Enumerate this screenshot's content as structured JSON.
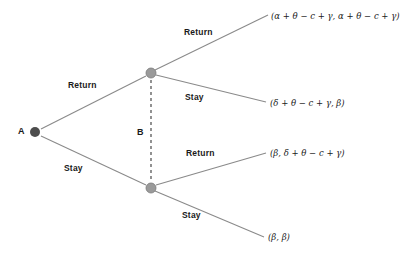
{
  "diagram": {
    "type": "game-tree",
    "title": "",
    "background_color": "#ffffff",
    "edge_color": "#8a8a8a",
    "info_set_color": "#4a4a4a",
    "nodes": [
      {
        "id": "A",
        "label": "A",
        "kind": "root-decision",
        "player": "A",
        "color": "#4d4d4d",
        "x": 35,
        "y": 132
      },
      {
        "id": "B_top",
        "label": "B",
        "kind": "decision",
        "player": "B",
        "color": "#9a9a9a",
        "x": 151,
        "y": 73
      },
      {
        "id": "B_bottom",
        "label": "",
        "kind": "decision",
        "player": "B",
        "color": "#9a9a9a",
        "x": 151,
        "y": 188
      }
    ],
    "information_set": {
      "label": "B",
      "style": "dashed",
      "connects": [
        "B_top",
        "B_bottom"
      ]
    },
    "edges": [
      {
        "from": "A",
        "to": "B_top",
        "label": "Return"
      },
      {
        "from": "A",
        "to": "B_bottom",
        "label": "Stay"
      },
      {
        "from": "B_top",
        "to": "payoff_1",
        "label": "Return"
      },
      {
        "from": "B_top",
        "to": "payoff_2",
        "label": "Stay"
      },
      {
        "from": "B_bottom",
        "to": "payoff_3",
        "label": "Return"
      },
      {
        "from": "B_bottom",
        "to": "payoff_4",
        "label": "Stay"
      }
    ],
    "payoffs": [
      {
        "id": "payoff_1",
        "text": "(α + θ − c + γ, α + θ − c + γ)"
      },
      {
        "id": "payoff_2",
        "text": "(δ + θ − c + γ, β)"
      },
      {
        "id": "payoff_3",
        "text": "(β, δ + θ − c + γ)"
      },
      {
        "id": "payoff_4",
        "text": "(β, β)"
      }
    ],
    "action_labels": {
      "a_return": "Return",
      "a_stay": "Stay",
      "b_top_return": "Return",
      "b_top_stay": "Stay",
      "b_bottom_return": "Return",
      "b_bottom_stay": "Stay"
    },
    "node_labels": {
      "root": "A",
      "info_set": "B"
    }
  }
}
